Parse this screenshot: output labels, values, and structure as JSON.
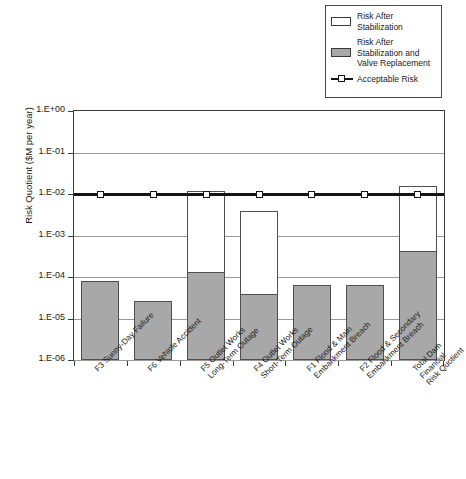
{
  "chart_data": {
    "type": "bar",
    "title": "",
    "subtitle": "",
    "xlabel": "",
    "ylabel": "Risk Quotient ($M per year)",
    "yscale": "log",
    "ylim": [
      1e-06,
      1
    ],
    "ytick_labels": [
      "1.E+00",
      "1.E-01",
      "1.E-02",
      "1.E-03",
      "1.E-04",
      "1.E-05",
      "1.E-06"
    ],
    "ytick_values": [
      1,
      0.1,
      0.01,
      0.001,
      0.0001,
      1e-05,
      1e-06
    ],
    "grid": true,
    "legend_position": "top-right",
    "stacked": true,
    "categories": [
      "F3 Sunny-Day Failure",
      "F6 Vehicle Accident",
      "F5 Outlet Works\nLong-Term Outage",
      "F4 Outlet Works\nShort-Term Outage",
      "F1 Flood & Main\nEmbankment Breach",
      "F2 Flood & Secondary\nEmbankment Breach",
      "Total Dam Financial\nRisk Quotient"
    ],
    "series": [
      {
        "name": "Risk After Stabilization and Valve Replacement",
        "fill": "#a8a8a8",
        "values": [
          8e-05,
          2.7e-05,
          0.00013,
          4e-05,
          6.5e-05,
          6.5e-05,
          0.00043
        ]
      },
      {
        "name": "Risk After Stabilization",
        "fill": "#ffffff",
        "values": [
          8e-05,
          2.7e-05,
          0.012,
          0.0038,
          6.5e-05,
          6.5e-05,
          0.0155
        ]
      }
    ],
    "reference_line": {
      "name": "Acceptable Risk",
      "value": 0.01,
      "color": "#151515",
      "marker": "open-square"
    }
  },
  "legend": {
    "items": [
      {
        "label": "Risk After\nStabilization",
        "swatch": "white-box"
      },
      {
        "label": "Risk After\nStabilization and\nValve Replacement",
        "swatch": "gray-box"
      },
      {
        "label": "Acceptable Risk",
        "swatch": "line-marker"
      }
    ]
  }
}
